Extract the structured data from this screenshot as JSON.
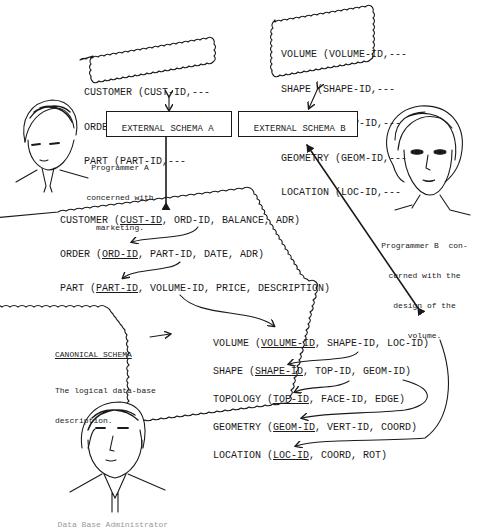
{
  "external_views": {
    "a": {
      "lines": [
        "CUSTOMER (CUST-ID,---",
        "ORDER (ORD-ID,---",
        "PART (PART-ID,---"
      ],
      "label": "EXTERNAL SCHEMA A"
    },
    "b": {
      "lines": [
        "VOLUME (VOLUME-ID,---",
        "SHAPE (SHAPE-ID,---",
        "TOPOLOGY (TOP-ID,---",
        "GEOMETRY (GEOM-ID,---",
        "LOCATION (LOC-ID,---"
      ],
      "label": "EXTERNAL SCHEMA B"
    }
  },
  "programmers": {
    "a": {
      "caption": [
        "Programmer A",
        "concerned with",
        "marketing."
      ]
    },
    "b": {
      "caption": [
        "Programmer B  con-",
        "cerned with the",
        "design of the",
        "volume."
      ]
    },
    "c": {
      "caption": "Data Base Administrator"
    }
  },
  "canonical": {
    "title": "CANONICAL SCHEMA",
    "description": [
      "The logical data-base",
      "description."
    ],
    "records": [
      {
        "name": "CUSTOMER",
        "key": "CUST-ID",
        "rest": ", ORD-ID, BALANCE, ADR)"
      },
      {
        "name": "ORDER",
        "key": "ORD-ID",
        "rest": ", PART-ID, DATE, ADR)"
      },
      {
        "name": "PART",
        "key": "PART-ID",
        "rest": ", VOLUME-ID, PRICE, DESCRIPTION)"
      },
      {
        "name": "VOLUME",
        "key": "VOLUME-ID",
        "rest": ", SHAPE-ID, LOC-ID)"
      },
      {
        "name": "SHAPE",
        "key": "SHAPE-ID",
        "rest": ", TOP-ID, GEOM-ID)"
      },
      {
        "name": "TOPOLOGY",
        "key": "TOP-ID",
        "rest": ", FACE-ID, EDGE)"
      },
      {
        "name": "GEOMETRY",
        "key": "GEOM-ID",
        "rest": ", VERT-ID, COORD)"
      },
      {
        "name": "LOCATION",
        "key": "LOC-ID",
        "rest": ", COORD, ROT)"
      }
    ]
  },
  "colors": {
    "ink": "#1a1a1a",
    "paper": "#ffffff"
  }
}
